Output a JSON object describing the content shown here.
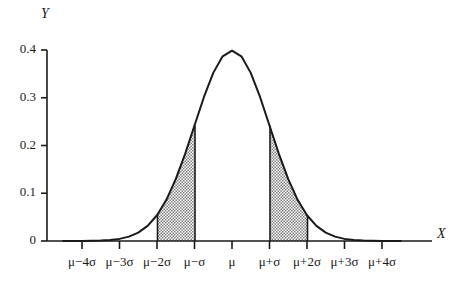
{
  "chart_data": {
    "type": "area",
    "title": "",
    "subtitle": "",
    "xlabel": "X",
    "ylabel": "Y",
    "curve": "normal probability density function",
    "distribution": {
      "mean_label": "μ",
      "sd_label": "σ",
      "peak_value": 0.4
    },
    "xlim": [
      -4.5,
      4.5
    ],
    "ylim": [
      0,
      0.4
    ],
    "grid": false,
    "legend": null,
    "x_ticks": [
      {
        "value": -4,
        "label": "μ−4σ"
      },
      {
        "value": -3,
        "label": "μ−3σ"
      },
      {
        "value": -2,
        "label": "μ−2σ"
      },
      {
        "value": -1,
        "label": "μ−σ"
      },
      {
        "value": 0,
        "label": "μ"
      },
      {
        "value": 1,
        "label": "μ+σ"
      },
      {
        "value": 2,
        "label": "μ+2σ"
      },
      {
        "value": 3,
        "label": "μ+3σ"
      },
      {
        "value": 4,
        "label": "μ+4σ"
      }
    ],
    "y_ticks": [
      {
        "value": 0.4,
        "label": "0.4"
      },
      {
        "value": 0.3,
        "label": "0.3"
      },
      {
        "value": 0.2,
        "label": "0.2"
      },
      {
        "value": 0.1,
        "label": "0.1"
      },
      {
        "value": 0,
        "label": "0"
      }
    ],
    "shaded_regions": [
      {
        "name": "left-shaded-band",
        "from": -2,
        "to": -1,
        "pattern": "stipple",
        "color": "#9a9a9a"
      },
      {
        "name": "right-shaded-band",
        "from": 1,
        "to": 2,
        "pattern": "stipple",
        "color": "#9a9a9a"
      }
    ],
    "series": [
      {
        "name": "normal-pdf",
        "x": [
          -4.5,
          -4.25,
          -4,
          -3.75,
          -3.5,
          -3.25,
          -3,
          -2.75,
          -2.5,
          -2.25,
          -2,
          -1.75,
          -1.5,
          -1.25,
          -1,
          -0.75,
          -0.5,
          -0.25,
          0,
          0.25,
          0.5,
          0.75,
          1,
          1.25,
          1.5,
          1.75,
          2,
          2.25,
          2.5,
          2.75,
          3,
          3.25,
          3.5,
          3.75,
          4,
          4.25,
          4.5
        ],
        "values": [
          0.0,
          0.0001,
          0.0001,
          0.0004,
          0.0009,
          0.002,
          0.0044,
          0.0091,
          0.0175,
          0.0317,
          0.054,
          0.0863,
          0.1295,
          0.1826,
          0.242,
          0.3011,
          0.3521,
          0.3867,
          0.3989,
          0.3867,
          0.3521,
          0.3011,
          0.242,
          0.1826,
          0.1295,
          0.0863,
          0.054,
          0.0317,
          0.0175,
          0.0091,
          0.0044,
          0.002,
          0.0009,
          0.0004,
          0.0001,
          0.0001,
          0.0
        ]
      }
    ]
  },
  "axes": {
    "y_title": "Y",
    "x_title": "X"
  }
}
